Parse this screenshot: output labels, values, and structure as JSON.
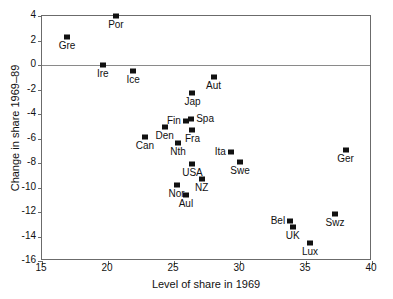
{
  "chart_data": {
    "type": "scatter",
    "title": "",
    "xlabel": "Level of share in 1969",
    "ylabel": "Change in share 1969–89",
    "xlim": [
      15,
      40
    ],
    "ylim": [
      -16,
      4
    ],
    "xticks": [
      15,
      20,
      25,
      30,
      35,
      40
    ],
    "yticks": [
      4,
      2,
      0,
      -2,
      -4,
      -6,
      -8,
      -10,
      -12,
      -14,
      -16
    ],
    "xticklabels": [
      "15",
      "20",
      "25",
      "30",
      "35",
      "40"
    ],
    "yticklabels": [
      "4",
      "2",
      "0",
      "-2",
      "-4",
      "-6",
      "-8",
      "-10",
      "-12",
      "-14",
      "-16"
    ],
    "grid": false,
    "legend": null,
    "annotations": [
      {
        "text": "zero reference line at y = 0"
      }
    ],
    "marker": "filled-square",
    "points": [
      {
        "label": "Por",
        "x": 20.6,
        "y": 4.0,
        "label_pos": "below"
      },
      {
        "label": "Gre",
        "x": 16.9,
        "y": 2.3,
        "label_pos": "below"
      },
      {
        "label": "Ire",
        "x": 19.6,
        "y": 0.0,
        "label_pos": "below"
      },
      {
        "label": "Ice",
        "x": 21.9,
        "y": -0.5,
        "label_pos": "below"
      },
      {
        "label": "Aut",
        "x": 28.0,
        "y": -1.0,
        "label_pos": "below"
      },
      {
        "label": "Jap",
        "x": 26.4,
        "y": -2.3,
        "label_pos": "below"
      },
      {
        "label": "Fin",
        "x": 25.9,
        "y": -4.6,
        "label_pos": "left"
      },
      {
        "label": "Spa",
        "x": 26.3,
        "y": -4.4,
        "label_pos": "right"
      },
      {
        "label": "Den",
        "x": 24.3,
        "y": -5.1,
        "label_pos": "below"
      },
      {
        "label": "Fra",
        "x": 26.4,
        "y": -5.3,
        "label_pos": "below"
      },
      {
        "label": "Can",
        "x": 22.8,
        "y": -5.9,
        "label_pos": "below"
      },
      {
        "label": "Nth",
        "x": 25.3,
        "y": -6.4,
        "label_pos": "below"
      },
      {
        "label": "Ger",
        "x": 38.0,
        "y": -6.9,
        "label_pos": "below"
      },
      {
        "label": "Ita",
        "x": 29.3,
        "y": -7.1,
        "label_pos": "left"
      },
      {
        "label": "Swe",
        "x": 30.0,
        "y": -7.9,
        "label_pos": "below"
      },
      {
        "label": "USA",
        "x": 26.4,
        "y": -8.1,
        "label_pos": "below"
      },
      {
        "label": "NZ",
        "x": 27.1,
        "y": -9.3,
        "label_pos": "below"
      },
      {
        "label": "Nor",
        "x": 25.2,
        "y": -9.8,
        "label_pos": "below"
      },
      {
        "label": "Aul",
        "x": 25.9,
        "y": -10.6,
        "label_pos": "below"
      },
      {
        "label": "Swz",
        "x": 37.2,
        "y": -12.2,
        "label_pos": "below"
      },
      {
        "label": "Bel",
        "x": 33.8,
        "y": -12.7,
        "label_pos": "left"
      },
      {
        "label": "UK",
        "x": 34.0,
        "y": -13.2,
        "label_pos": "below"
      },
      {
        "label": "Lux",
        "x": 35.3,
        "y": -14.5,
        "label_pos": "below"
      }
    ]
  }
}
